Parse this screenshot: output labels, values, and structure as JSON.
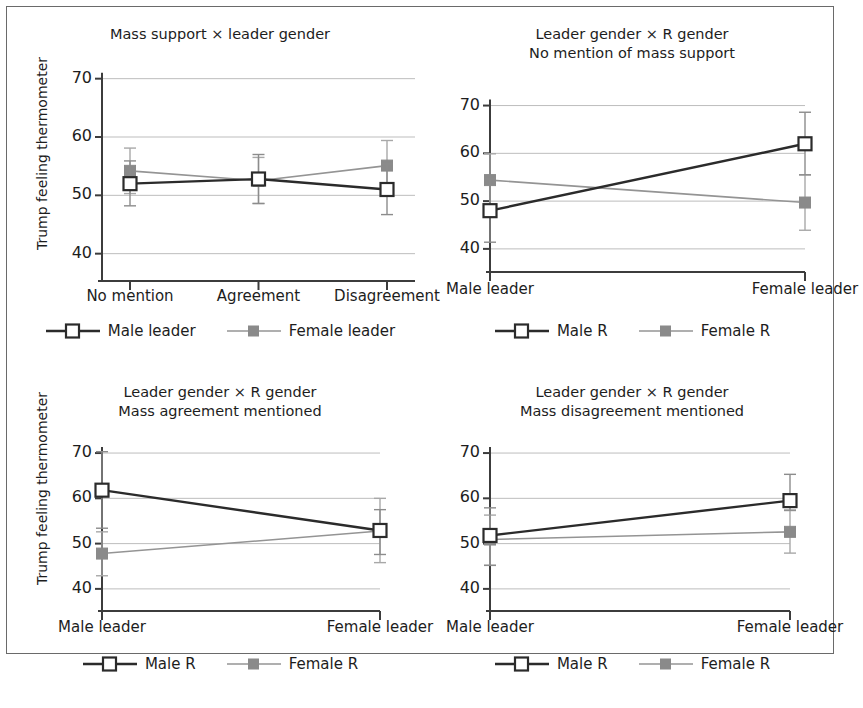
{
  "figure": {
    "y_axis_label": "Trump feeling thermometer",
    "y_ticks": [
      "70",
      "60",
      "50",
      "40"
    ],
    "y_values": [
      70,
      60,
      50,
      40
    ],
    "ylim": [
      36,
      72
    ]
  },
  "panels": [
    {
      "id": "panel-mass-support-leader-gender",
      "title_line1": "Mass support × leader gender",
      "title_line2": "",
      "x_categories": [
        "No mention",
        "Agreement",
        "Disagreement"
      ],
      "legend": [
        "Male leader",
        "Female leader"
      ],
      "series": [
        {
          "name": "Male leader",
          "style": "solid-dark-open-square",
          "values": [
            52.0,
            52.8,
            51.0
          ],
          "ci_low": [
            48.2,
            48.6,
            46.7
          ],
          "ci_high": [
            55.9,
            57.0,
            55.4
          ]
        },
        {
          "name": "Female leader",
          "style": "light-gray-filled-square",
          "values": [
            54.2,
            52.5,
            55.1
          ],
          "ci_low": [
            50.3,
            48.6,
            50.8
          ],
          "ci_high": [
            58.1,
            56.5,
            59.4
          ]
        }
      ]
    },
    {
      "id": "panel-no-mention",
      "title_line1": "Leader gender × R gender",
      "title_line2": "No mention of mass support",
      "x_categories": [
        "Male leader",
        "Female leader"
      ],
      "legend": [
        "Male R",
        "Female R"
      ],
      "series": [
        {
          "name": "Male R",
          "style": "solid-dark-open-square",
          "values": [
            48.0,
            62.0
          ],
          "ci_low": [
            41.4,
            55.5
          ],
          "ci_high": [
            54.6,
            68.6
          ]
        },
        {
          "name": "Female R",
          "style": "light-gray-filled-square",
          "values": [
            54.4,
            49.7
          ],
          "ci_low": [
            48.7,
            43.9
          ],
          "ci_high": [
            59.9,
            55.5
          ]
        }
      ]
    },
    {
      "id": "panel-mass-agreement",
      "title_line1": "Leader gender × R gender",
      "title_line2": "Mass agreement mentioned",
      "x_categories": [
        "Male leader",
        "Female leader"
      ],
      "legend": [
        "Male R",
        "Female R"
      ],
      "series": [
        {
          "name": "Male R",
          "style": "solid-dark-open-square",
          "values": [
            61.8,
            52.9
          ],
          "ci_low": [
            53.4,
            47.6
          ],
          "ci_high": [
            70.3,
            57.5
          ]
        },
        {
          "name": "Female R",
          "style": "light-gray-filled-square",
          "values": [
            47.8,
            52.8
          ],
          "ci_low": [
            42.9,
            45.8
          ],
          "ci_high": [
            52.6,
            60.0
          ]
        }
      ]
    },
    {
      "id": "panel-mass-disagreement",
      "title_line1": "Leader gender × R gender",
      "title_line2": "Mass disagreement mentioned",
      "x_categories": [
        "Male leader",
        "Female leader"
      ],
      "legend": [
        "Male R",
        "Female R"
      ],
      "series": [
        {
          "name": "Male R",
          "style": "solid-dark-open-square",
          "values": [
            51.8,
            59.5
          ],
          "ci_low": [
            45.2,
            57.4
          ],
          "ci_high": [
            57.9,
            65.3
          ]
        },
        {
          "name": "Female R",
          "style": "light-gray-filled-square",
          "values": [
            50.9,
            52.6
          ],
          "ci_low": [
            45.2,
            47.9
          ],
          "ci_high": [
            56.3,
            57.3
          ]
        }
      ]
    }
  ],
  "chart_data": {
    "type": "line",
    "xlabel": "",
    "ylabel": "Trump feeling thermometer",
    "ylim": [
      36,
      72
    ],
    "yticks": [
      40,
      50,
      60,
      70
    ],
    "grid": "horizontal",
    "legend_position": "below-axis",
    "error_bars": "95% confidence intervals",
    "panels": [
      {
        "title": "Mass support × leader gender",
        "categories": [
          "No mention",
          "Agreement",
          "Disagreement"
        ],
        "series": [
          {
            "name": "Male leader",
            "values": [
              52.0,
              52.8,
              51.0
            ],
            "ci_low": [
              48.2,
              48.6,
              46.7
            ],
            "ci_high": [
              55.9,
              57.0,
              55.4
            ]
          },
          {
            "name": "Female leader",
            "values": [
              54.2,
              52.5,
              55.1
            ],
            "ci_low": [
              50.3,
              48.6,
              50.8
            ],
            "ci_high": [
              58.1,
              56.5,
              59.4
            ]
          }
        ]
      },
      {
        "title": "Leader gender × R gender — No mention of mass support",
        "categories": [
          "Male leader",
          "Female leader"
        ],
        "series": [
          {
            "name": "Male R",
            "values": [
              48.0,
              62.0
            ],
            "ci_low": [
              41.4,
              55.5
            ],
            "ci_high": [
              54.6,
              68.6
            ]
          },
          {
            "name": "Female R",
            "values": [
              54.4,
              49.7
            ],
            "ci_low": [
              48.7,
              43.9
            ],
            "ci_high": [
              59.9,
              55.5
            ]
          }
        ]
      },
      {
        "title": "Leader gender × R gender — Mass agreement mentioned",
        "categories": [
          "Male leader",
          "Female leader"
        ],
        "series": [
          {
            "name": "Male R",
            "values": [
              61.8,
              52.9
            ],
            "ci_low": [
              53.4,
              47.6
            ],
            "ci_high": [
              70.3,
              57.5
            ]
          },
          {
            "name": "Female R",
            "values": [
              47.8,
              52.8
            ],
            "ci_low": [
              42.9,
              45.8
            ],
            "ci_high": [
              52.6,
              60.0
            ]
          }
        ]
      },
      {
        "title": "Leader gender × R gender — Mass disagreement mentioned",
        "categories": [
          "Male leader",
          "Female leader"
        ],
        "series": [
          {
            "name": "Male R",
            "values": [
              51.8,
              59.5
            ],
            "ci_low": [
              45.2,
              57.4
            ],
            "ci_high": [
              57.9,
              65.3
            ]
          },
          {
            "name": "Female R",
            "values": [
              50.9,
              52.6
            ],
            "ci_low": [
              45.2,
              47.9
            ],
            "ci_high": [
              56.3,
              57.3
            ]
          }
        ]
      }
    ]
  }
}
